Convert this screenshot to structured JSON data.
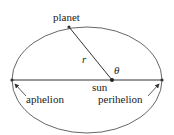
{
  "diagram": {
    "labels": {
      "planet": "planet",
      "r": "r",
      "theta": "θ",
      "sun": "sun",
      "aphelion": "aphelion",
      "perihelion": "perihelion"
    },
    "colors": {
      "stroke": "#333333",
      "text": "#222222"
    }
  }
}
